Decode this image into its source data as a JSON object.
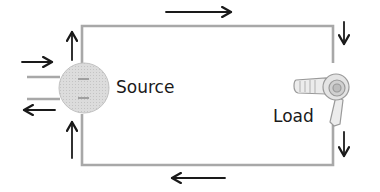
{
  "diagram": {
    "source": {
      "label": "Source",
      "icon": "ac-source-circle"
    },
    "load": {
      "label": "Load",
      "icon": "hair-dryer-icon"
    },
    "colors": {
      "wire": "#a8a8a8",
      "arrow": "#1a1a1a",
      "source_fill": "#d9d9d9",
      "source_stroke": "#bdbdbd",
      "load_stroke": "#9a9a9a",
      "load_fill": "#ececec",
      "text": "#1a1a1a"
    },
    "current_arrows": [
      {
        "id": "top",
        "direction": "right"
      },
      {
        "id": "right-upper",
        "direction": "down"
      },
      {
        "id": "right-lower",
        "direction": "down"
      },
      {
        "id": "bottom",
        "direction": "left"
      },
      {
        "id": "left-lower",
        "direction": "up"
      },
      {
        "id": "left-upper",
        "direction": "up"
      },
      {
        "id": "input-in",
        "direction": "right"
      },
      {
        "id": "input-out",
        "direction": "left"
      }
    ]
  }
}
